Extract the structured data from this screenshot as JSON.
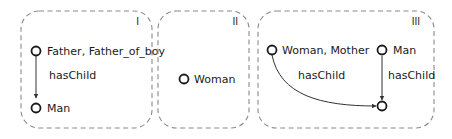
{
  "panels": [
    {
      "id": "I",
      "label": "I",
      "nodes": [
        {
          "id": "n1",
          "label": "Father, Father_of_boy"
        },
        {
          "id": "n2",
          "label": "Man"
        }
      ],
      "edges": [
        {
          "from": "n1",
          "to": "n2",
          "label": "hasChild"
        }
      ]
    },
    {
      "id": "II",
      "label": "II",
      "nodes": [
        {
          "id": "n3",
          "label": "Woman"
        }
      ],
      "edges": []
    },
    {
      "id": "III",
      "label": "III",
      "nodes": [
        {
          "id": "n4",
          "label": "Woman, Mother"
        },
        {
          "id": "n5",
          "label": "Man"
        },
        {
          "id": "n6",
          "label": ""
        }
      ],
      "edges": [
        {
          "from": "n4",
          "to": "n6",
          "label": "hasChild"
        },
        {
          "from": "n5",
          "to": "n6",
          "label": "hasChild"
        }
      ]
    }
  ],
  "colors": {
    "border": "#8a8a8a",
    "node": "#1a1a1a",
    "edge": "#333333"
  }
}
